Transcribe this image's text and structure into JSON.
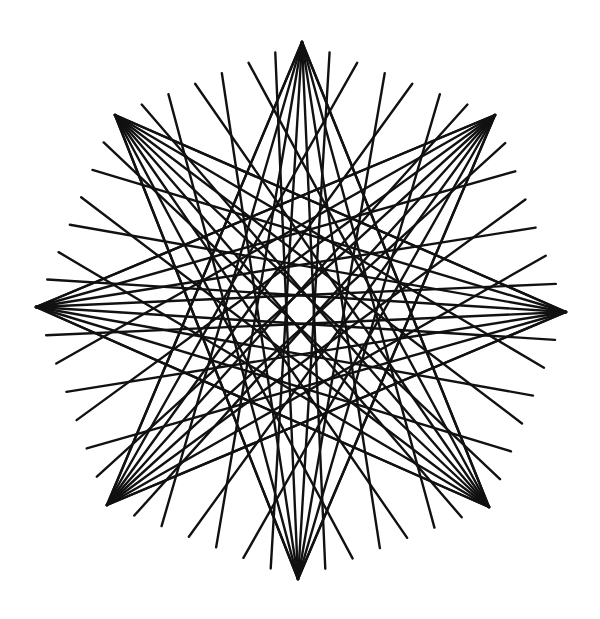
{
  "figure": {
    "type": "string-art-star",
    "points": 8,
    "lines_per_tip": 8,
    "stroke_color": "#111111",
    "background_color": "#ffffff",
    "tips": [
      {
        "name": "top",
        "x": 302,
        "y": 42
      },
      {
        "name": "top-right",
        "x": 495,
        "y": 115
      },
      {
        "name": "right",
        "x": 566,
        "y": 312
      },
      {
        "name": "bottom-right",
        "x": 489,
        "y": 507
      },
      {
        "name": "bottom",
        "x": 298,
        "y": 579
      },
      {
        "name": "bottom-left",
        "x": 107,
        "y": 505
      },
      {
        "name": "left",
        "x": 36,
        "y": 307
      },
      {
        "name": "top-left",
        "x": 115,
        "y": 115
      }
    ]
  }
}
